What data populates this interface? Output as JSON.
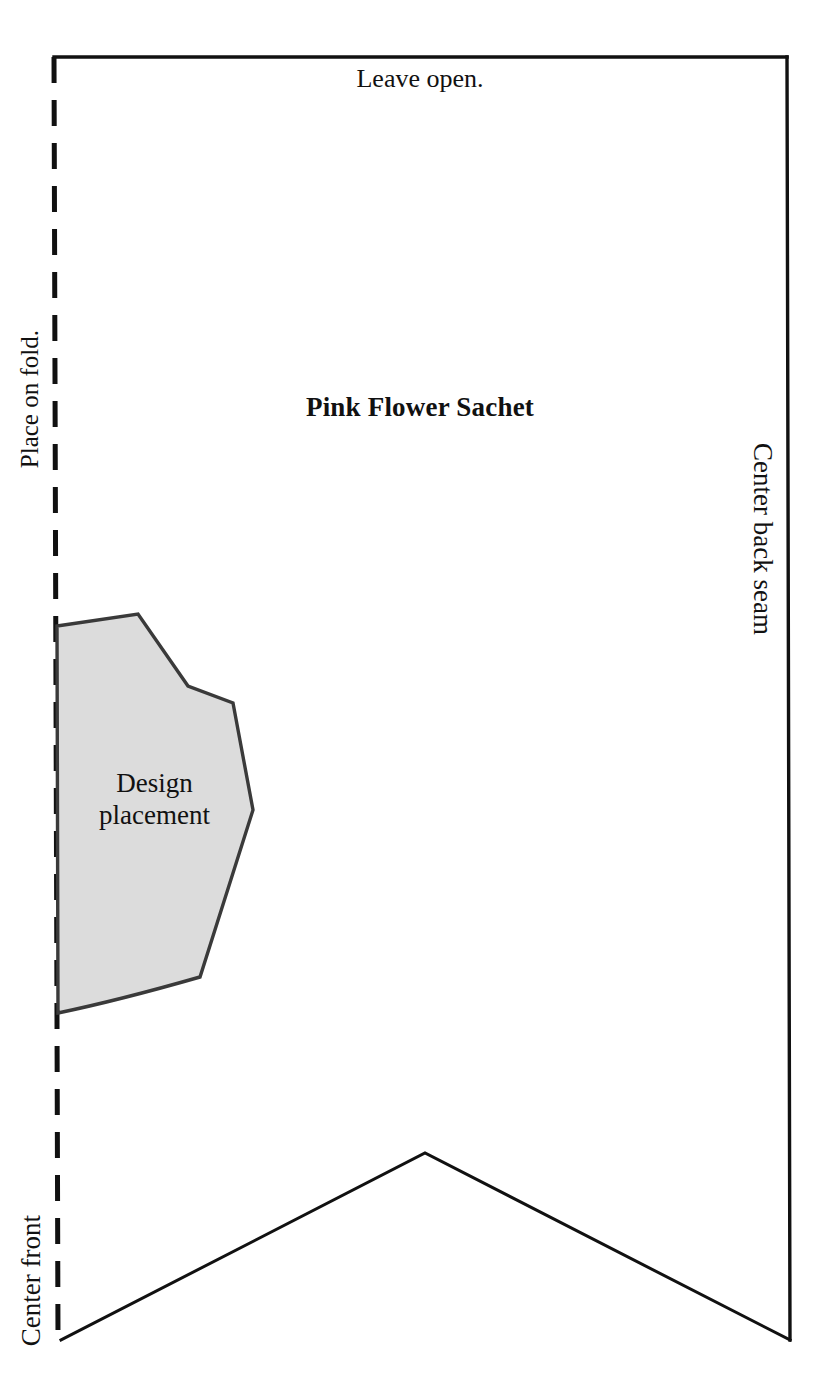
{
  "pattern": {
    "title": "Pink Flower Sachet",
    "top_instruction": "Leave open.",
    "fold_label": "Place on fold.",
    "center_front_label": "Center front",
    "center_back_label": "Center back seam",
    "design_area_label_line1": "Design",
    "design_area_label_line2": "placement",
    "colors": {
      "ink": "#111111",
      "design_fill": "#dcdcdc",
      "design_stroke": "#3a3a3a",
      "paper": "#ffffff"
    },
    "geometry": {
      "top_edge_y": 57,
      "left_fold_x": 54,
      "right_seam_x": 787,
      "bottom_y": 1340,
      "chevron_apex": [
        425,
        1153
      ],
      "fold_dash_length": 26,
      "fold_dash_gap": 17,
      "outline_stroke_width": 3,
      "fold_stroke_width": 5,
      "design_polygon": [
        [
          57,
          626
        ],
        [
          138,
          614
        ],
        [
          188,
          686
        ],
        [
          233,
          703
        ],
        [
          253,
          810
        ],
        [
          200,
          977
        ],
        [
          58,
          1013
        ]
      ]
    }
  }
}
